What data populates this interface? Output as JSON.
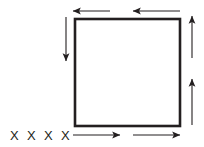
{
  "figure": {
    "type": "physics-diagram",
    "background_color": "#ffffff",
    "stroke_color": "#231f20",
    "loop": {
      "name": "square-loop",
      "x": 75,
      "y": 19,
      "width": 105,
      "height": 107,
      "stroke_width": 2.6
    },
    "arrows": [
      {
        "id": "top-left-arrow",
        "name": "current-arrow-top-left",
        "direction": "left",
        "x1": 110,
        "y1": 11,
        "x2": 73,
        "y2": 11
      },
      {
        "id": "top-right-arrow",
        "name": "current-arrow-top-right",
        "direction": "left",
        "x1": 180,
        "y1": 11,
        "x2": 133,
        "y2": 11
      },
      {
        "id": "right-upper-arrow",
        "name": "current-arrow-right-upper",
        "direction": "up",
        "x1": 192,
        "y1": 58,
        "x2": 192,
        "y2": 16
      },
      {
        "id": "right-lower-arrow",
        "name": "current-arrow-right-lower",
        "direction": "up",
        "x1": 192,
        "y1": 125,
        "x2": 192,
        "y2": 79
      },
      {
        "id": "bottom-left-arrow",
        "name": "current-arrow-bottom-left",
        "direction": "right",
        "x1": 73,
        "y1": 135,
        "x2": 120,
        "y2": 135
      },
      {
        "id": "bottom-right-arrow",
        "name": "current-arrow-bottom-right",
        "direction": "right",
        "x1": 133,
        "y1": 135,
        "x2": 180,
        "y2": 135
      },
      {
        "id": "left-arrow",
        "name": "current-arrow-left",
        "direction": "down",
        "x1": 66,
        "y1": 17,
        "x2": 66,
        "y2": 61
      }
    ],
    "field_markers": {
      "name": "magnetic-field-into-page",
      "symbol": "X",
      "count": 4,
      "font_size": 13,
      "baseline_y": 140,
      "x_positions": [
        10,
        27,
        44,
        61
      ],
      "labels": [
        "X",
        "X",
        "X",
        "X"
      ]
    }
  }
}
